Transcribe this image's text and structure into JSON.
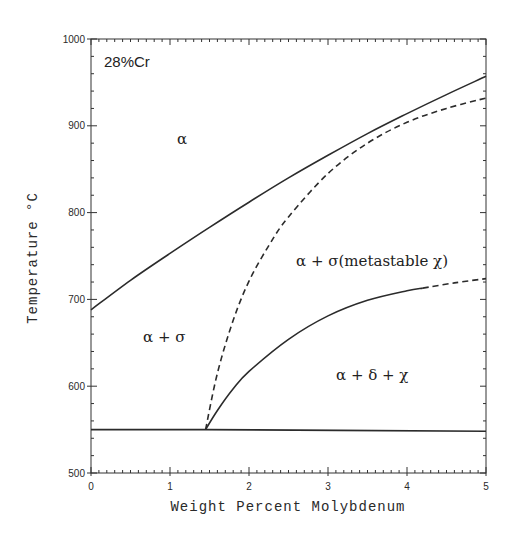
{
  "chart_data": {
    "type": "line",
    "title": "",
    "subtitle": "",
    "xlabel": "Weight Percent Molybdenum",
    "ylabel": "Temperature °C",
    "xlim": [
      0,
      5
    ],
    "ylim": [
      500,
      1000
    ],
    "x_ticks": [
      0,
      1,
      2,
      3,
      4,
      5
    ],
    "y_ticks": [
      500,
      600,
      700,
      800,
      900,
      1000
    ],
    "grid": false,
    "legend": null,
    "annotations": [
      {
        "text": "28%Cr",
        "x": 0.15,
        "y": 970
      },
      {
        "text": "α",
        "x": 1.1,
        "y": 880
      },
      {
        "text": "α + σ",
        "x": 0.85,
        "y": 655
      },
      {
        "text": "α + σ(metastable χ)",
        "x": 3.6,
        "y": 736
      },
      {
        "text": "α + δ + χ",
        "x": 3.75,
        "y": 635
      }
    ],
    "series": [
      {
        "name": "alpha / alpha+sigma boundary",
        "style": "solid",
        "x": [
          0,
          0.5,
          1,
          1.5,
          2,
          2.5,
          3,
          3.5,
          4,
          4.5,
          5
        ],
        "y": [
          688,
          722,
          753,
          783,
          812,
          840,
          866,
          891,
          914,
          936,
          957
        ]
      },
      {
        "name": "eutectoid horizontal",
        "style": "solid",
        "x": [
          0,
          1.45,
          5
        ],
        "y": [
          550,
          550,
          548
        ]
      },
      {
        "name": "metastable chi boundary",
        "style": "dashed",
        "x": [
          1.45,
          1.6,
          1.8,
          2,
          2.25,
          2.5,
          3,
          3.5,
          4,
          4.5,
          5
        ],
        "y": [
          550,
          615,
          676,
          721,
          762,
          795,
          845,
          880,
          904,
          920,
          932
        ]
      },
      {
        "name": "alpha+sigma / alpha+delta+chi boundary",
        "style": "solid",
        "x": [
          1.45,
          1.6,
          1.8,
          2,
          2.5,
          3,
          3.5,
          4,
          4.2
        ],
        "y": [
          550,
          572,
          597,
          617,
          654,
          681,
          699,
          710,
          713
        ]
      },
      {
        "name": "alpha+sigma / alpha+delta+chi boundary (extrapolated)",
        "style": "dashed",
        "x": [
          4.2,
          4.6,
          5
        ],
        "y": [
          713,
          719,
          724
        ]
      }
    ]
  },
  "labels": {
    "composition": "28%Cr",
    "region_alpha": "α",
    "region_alpha_sigma": "α + σ",
    "region_metastable": "α + σ(metastable χ)",
    "region_alpha_delta_chi": "α + δ + χ",
    "x_axis_title": "Weight Percent Molybdenum",
    "y_axis_title": "Temperature °C",
    "x_ticks": [
      "0",
      "1",
      "2",
      "3",
      "4",
      "5"
    ],
    "y_ticks": [
      "500",
      "600",
      "700",
      "800",
      "900",
      "1000"
    ]
  }
}
